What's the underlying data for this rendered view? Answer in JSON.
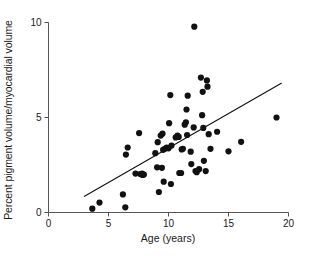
{
  "chart_data": {
    "type": "scatter",
    "title": "",
    "xlabel": "Age (years)",
    "ylabel": "Percent pigment volume/myocardial volume",
    "xlim": [
      0,
      20
    ],
    "ylim": [
      0,
      10
    ],
    "xticks": [
      0,
      5,
      10,
      15,
      20
    ],
    "yticks": [
      0,
      5,
      10
    ],
    "xtick_labels": [
      "0",
      "5",
      "10",
      "15",
      "20"
    ],
    "ytick_labels": [
      "0",
      "5",
      "10"
    ],
    "grid": false,
    "legend": null,
    "marker_color": "#111111",
    "marker_size": 3.1,
    "axis_color": "#555555",
    "series": [
      {
        "name": "subjects",
        "points": [
          [
            3.65,
            0.2
          ],
          [
            4.25,
            0.52
          ],
          [
            6.2,
            0.95
          ],
          [
            6.4,
            0.27
          ],
          [
            6.45,
            3.05
          ],
          [
            6.6,
            3.42
          ],
          [
            7.25,
            2.05
          ],
          [
            7.55,
            4.18
          ],
          [
            7.65,
            2.02
          ],
          [
            7.8,
            2.05
          ],
          [
            7.85,
            1.98
          ],
          [
            7.95,
            2.0
          ],
          [
            8.9,
            3.12
          ],
          [
            9.05,
            2.38
          ],
          [
            9.1,
            3.7
          ],
          [
            9.2,
            1.08
          ],
          [
            9.35,
            4.05
          ],
          [
            9.45,
            2.35
          ],
          [
            9.5,
            4.15
          ],
          [
            9.55,
            3.3
          ],
          [
            9.6,
            1.62
          ],
          [
            9.7,
            3.35
          ],
          [
            9.85,
            3.42
          ],
          [
            10.0,
            3.38
          ],
          [
            10.05,
            4.7
          ],
          [
            10.15,
            6.18
          ],
          [
            10.2,
            1.5
          ],
          [
            10.25,
            3.52
          ],
          [
            10.6,
            3.95
          ],
          [
            10.75,
            4.05
          ],
          [
            10.85,
            3.98
          ],
          [
            10.9,
            2.08
          ],
          [
            11.05,
            2.08
          ],
          [
            11.1,
            3.32
          ],
          [
            11.2,
            3.35
          ],
          [
            11.35,
            4.62
          ],
          [
            11.45,
            4.75
          ],
          [
            11.5,
            5.42
          ],
          [
            11.55,
            4.08
          ],
          [
            11.6,
            6.15
          ],
          [
            11.85,
            3.2
          ],
          [
            11.9,
            2.55
          ],
          [
            12.1,
            4.48
          ],
          [
            12.15,
            9.78
          ],
          [
            12.25,
            2.18
          ],
          [
            12.35,
            2.12
          ],
          [
            12.55,
            2.28
          ],
          [
            12.7,
            7.1
          ],
          [
            12.8,
            5.12
          ],
          [
            12.85,
            6.35
          ],
          [
            12.9,
            4.45
          ],
          [
            12.95,
            2.72
          ],
          [
            13.1,
            2.18
          ],
          [
            13.2,
            6.95
          ],
          [
            13.25,
            6.62
          ],
          [
            13.35,
            4.12
          ],
          [
            13.5,
            3.35
          ],
          [
            14.05,
            4.25
          ],
          [
            15.0,
            3.22
          ],
          [
            16.05,
            3.72
          ],
          [
            19.0,
            5.0
          ]
        ]
      }
    ],
    "trendline": {
      "type": "line",
      "x_start": 3.0,
      "y_start": 0.85,
      "x_end": 19.4,
      "y_end": 6.8,
      "color": "#111111",
      "width": 1.1
    }
  }
}
